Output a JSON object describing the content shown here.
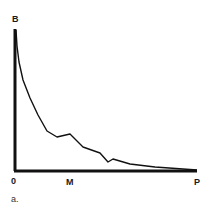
{
  "chart_data": {
    "type": "line",
    "title": "",
    "panel_label": "a.",
    "xlabel": "",
    "ylabel": "",
    "y_axis_label": "B",
    "x_tick_labels": [
      "0",
      "M",
      "P"
    ],
    "grid": false,
    "legend": null,
    "series": [
      {
        "name": "curve",
        "points_px": [
          [
            16,
            30
          ],
          [
            17,
            46
          ],
          [
            19,
            62
          ],
          [
            23,
            80
          ],
          [
            30,
            98
          ],
          [
            38,
            115
          ],
          [
            47,
            131
          ],
          [
            57,
            137
          ],
          [
            70,
            134
          ],
          [
            83,
            147
          ],
          [
            100,
            153
          ],
          [
            108,
            162
          ],
          [
            113,
            159
          ],
          [
            130,
            164
          ],
          [
            155,
            167
          ],
          [
            197,
            170
          ]
        ]
      }
    ],
    "axes_px": {
      "origin": [
        15,
        171
      ],
      "y_top": 29,
      "x_end": 197
    }
  },
  "colors": {
    "line": "#111111",
    "axis": "#111111"
  }
}
